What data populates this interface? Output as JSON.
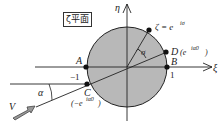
{
  "plane_label": "ζ平面",
  "axes": {
    "horizontal": "ξ",
    "vertical": "η"
  },
  "points": {
    "A": "A",
    "B": "B",
    "C": "C",
    "D": "D",
    "zeta": "ζ = e",
    "zeta_exp": "iσ",
    "D_value": "(e",
    "D_exp": "iα0",
    "D_close": ")",
    "C_value": "(−e",
    "C_exp": "iα0",
    "C_close": ")"
  },
  "ticks": {
    "minus_one": "−1",
    "one": "1"
  },
  "angles": {
    "sigma": "σ",
    "alpha": "α"
  },
  "flow": {
    "label": "V"
  },
  "colors": {
    "disk": "#b8b8b8",
    "line": "#222222"
  }
}
